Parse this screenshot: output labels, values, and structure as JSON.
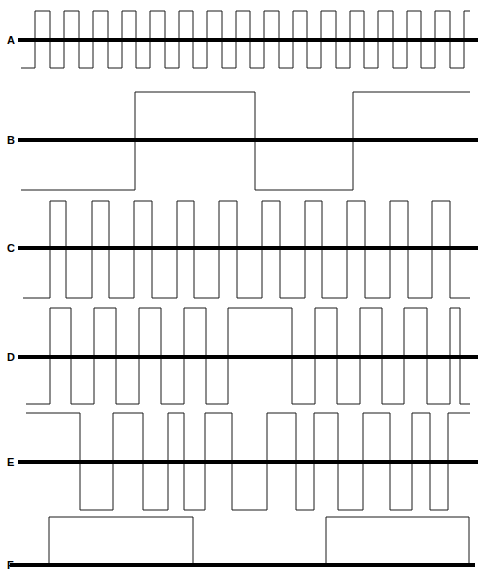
{
  "figure": {
    "kind": "timing-diagram",
    "background_color": "#ffffff",
    "wave_stroke_color": "#1a1a1a",
    "baseline_color": "#000000",
    "wave_stroke_width": 1,
    "baseline_stroke_width": 4,
    "width": 485,
    "height": 575
  },
  "chart_data": {
    "type": "line",
    "title": "",
    "xlabel": "",
    "ylabel": "",
    "x_range": [
      0,
      485
    ],
    "grid": false,
    "legend_position": "left-labels",
    "series": [
      {
        "name": "A",
        "label": "A",
        "label_x": 7,
        "label_y": 40,
        "baseline_y": 40,
        "high_y": 11,
        "low_y": 68,
        "start_level": "low",
        "x_start": 21,
        "x_end": 470,
        "description": "Fast symmetric square wave, 16 cycles",
        "edges": [
          21,
          35,
          50,
          64,
          79,
          93,
          108,
          122,
          136,
          150,
          165,
          179,
          193,
          207,
          222,
          236,
          250,
          264,
          279,
          293,
          307,
          321,
          336,
          350,
          364,
          378,
          393,
          407,
          421,
          435,
          450,
          464
        ]
      },
      {
        "name": "B",
        "label": "B",
        "label_x": 7,
        "label_y": 140,
        "baseline_y": 140,
        "high_y": 92,
        "low_y": 190,
        "start_level": "low",
        "x_start": 21,
        "x_end": 470,
        "description": "Slow square wave, two positive pulses",
        "edges": [
          21,
          135,
          255,
          353
        ]
      },
      {
        "name": "C",
        "label": "C",
        "label_x": 7,
        "label_y": 248,
        "baseline_y": 248,
        "high_y": 201,
        "low_y": 298,
        "start_level": "low",
        "x_start": 23,
        "x_end": 470,
        "description": "Medium square wave, 11 narrow pulses",
        "edges": [
          23,
          50,
          66,
          92,
          109,
          134,
          152,
          177,
          194,
          219,
          237,
          262,
          280,
          305,
          322,
          347,
          365,
          390,
          408,
          432,
          450,
          470
        ]
      },
      {
        "name": "D",
        "label": "D",
        "label_x": 7,
        "label_y": 357,
        "baseline_y": 357,
        "high_y": 308,
        "low_y": 404,
        "start_level": "low",
        "x_start": 26,
        "x_end": 470,
        "description": "Wider pulses with a gap near centre",
        "edges": [
          26,
          50,
          71,
          94,
          116,
          139,
          161,
          184,
          206,
          228,
          292,
          315,
          337,
          360,
          382,
          404,
          427,
          450,
          460,
          470
        ]
      },
      {
        "name": "E",
        "label": "E",
        "label_x": 7,
        "label_y": 462,
        "baseline_y": 462,
        "high_y": 413,
        "low_y": 510,
        "start_level": "high",
        "x_start": 26,
        "x_end": 470,
        "description": "Starts high, irregular pulse widths",
        "edges": [
          26,
          80,
          113,
          143,
          168,
          184,
          205,
          232,
          267,
          296,
          314,
          338,
          363,
          390,
          412,
          430,
          448,
          470
        ]
      },
      {
        "name": "F",
        "label": "F",
        "label_x": 7,
        "label_y": 565,
        "baseline_y": 565,
        "high_y": 517,
        "low_y": 565,
        "start_level": "low",
        "x_start": 10,
        "x_end": 475,
        "description": "Two wide positive-only pulses, no negative swing",
        "edges": [
          49,
          193,
          326,
          469
        ]
      }
    ]
  }
}
